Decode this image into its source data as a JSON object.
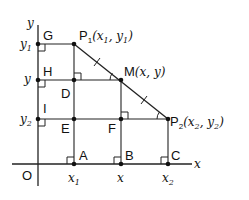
{
  "diagram": {
    "axes": {
      "x_label": "x",
      "y_label": "y",
      "origin_label": "O"
    },
    "points": {
      "G": {
        "label": "G"
      },
      "H": {
        "label": "H"
      },
      "I": {
        "label": "I"
      },
      "D": {
        "label": "D"
      },
      "E": {
        "label": "E"
      },
      "F": {
        "label": "F"
      },
      "A": {
        "label": "A"
      },
      "B": {
        "label": "B"
      },
      "C": {
        "label": "C"
      },
      "P1": {
        "label": "P",
        "sub": "1",
        "coords_open": "(",
        "x": "x",
        "x_sub": "1",
        "sep": ", ",
        "y": "y",
        "y_sub": "1",
        "coords_close": ")"
      },
      "P2": {
        "label": "P",
        "sub": "2",
        "coords_open": "(",
        "x": "x",
        "x_sub": "2",
        "sep": ", ",
        "y": "y",
        "y_sub": "2",
        "coords_close": ")"
      },
      "M": {
        "label": "M",
        "coords": "(x, y)",
        "coords_open": "(",
        "x": "x",
        "sep": ", ",
        "y": "y",
        "coords_close": ")"
      }
    },
    "y_ticks": [
      {
        "name": "y",
        "sub": "1"
      },
      {
        "name": "y",
        "sub": ""
      },
      {
        "name": "y",
        "sub": "2"
      }
    ],
    "x_ticks": [
      {
        "name": "x",
        "sub": "1"
      },
      {
        "name": "x",
        "sub": ""
      },
      {
        "name": "x",
        "sub": "2"
      }
    ],
    "line_color": "#222222"
  }
}
